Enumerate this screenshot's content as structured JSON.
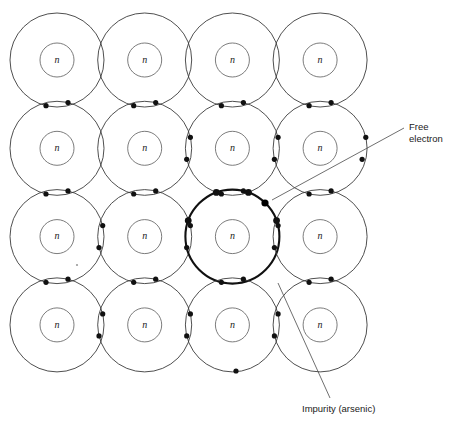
{
  "figure": {
    "background_color": "#ffffff",
    "width": 458,
    "height": 435
  },
  "lattice": {
    "rows": 4,
    "cols": 4,
    "origin_x": 57,
    "origin_y": 60,
    "spacing_x": 87.7,
    "spacing_y": 88.3,
    "shell_radius": 47,
    "core_radius": 17,
    "core_label": "n",
    "shell_color": "#3b3b3b",
    "core_color": "#5a5a5a",
    "electron_color": "#111111",
    "electron_radius": 2.6
  },
  "impurity": {
    "row": 2,
    "col": 2,
    "label": "Impurity (arsenic)",
    "shell_color": "#111111",
    "shell_width": 2.1,
    "leader": {
      "x1": 278,
      "y1": 283,
      "x2": 330,
      "y2": 398
    },
    "text_x": 302,
    "text_y": 412
  },
  "free_electron": {
    "label_line_1": "Free",
    "label_line_2": "electron",
    "dot_x": 265,
    "dot_y": 203,
    "dot_radius": 3.6,
    "leader": {
      "x1": 272,
      "y1": 200,
      "x2": 404,
      "y2": 128
    },
    "text_x": 409,
    "text_y": 130
  },
  "bonds": {
    "horizontal_pair_note": "two valence electrons per horizontal lens",
    "vertical_pair_note": "two valence electrons per vertical lens"
  },
  "colors": {
    "ink": "#1a1a1a",
    "shell": "#3b3b3b",
    "core": "#5a5a5a",
    "leader": "#4a4a4a",
    "paper": "#ffffff"
  }
}
